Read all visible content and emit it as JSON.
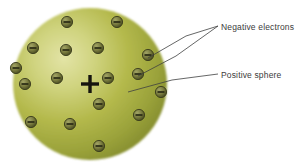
{
  "figure": {
    "background_color": "#ffffff"
  },
  "sphere": {
    "name": "positive-sphere",
    "cx": 90,
    "cy": 84,
    "rx": 77,
    "ry": 76,
    "fill_center_color": "#dcdd9a",
    "fill_mid_color": "#b6bb4b",
    "fill_edge_color": "#8e9633",
    "highlight_cx_pct": 33,
    "highlight_cy_pct": 33
  },
  "nucleus": {
    "name": "positive-charge-plus",
    "symbol": "+",
    "cx": 90,
    "cy": 84,
    "arm": 9,
    "thickness": 3.4,
    "color": "#16150f"
  },
  "electrons": {
    "name": "negative-electrons",
    "symbol": "−",
    "count": 17,
    "radius": 5.6,
    "body_color": "#8d8f4e",
    "body_dark_color": "#5d5f2d",
    "edge_color": "#3a3b1c",
    "bar_color": "#2b2c14",
    "positions": [
      {
        "x": 67,
        "y": 22
      },
      {
        "x": 117,
        "y": 22
      },
      {
        "x": 33,
        "y": 48
      },
      {
        "x": 66,
        "y": 50
      },
      {
        "x": 98,
        "y": 48
      },
      {
        "x": 148,
        "y": 55
      },
      {
        "x": 25,
        "y": 84
      },
      {
        "x": 57,
        "y": 78
      },
      {
        "x": 108,
        "y": 78
      },
      {
        "x": 138,
        "y": 74
      },
      {
        "x": 99,
        "y": 104
      },
      {
        "x": 31,
        "y": 122
      },
      {
        "x": 70,
        "y": 124
      },
      {
        "x": 139,
        "y": 115
      },
      {
        "x": 99,
        "y": 146
      },
      {
        "x": 161,
        "y": 92
      },
      {
        "x": 16,
        "y": 68
      }
    ]
  },
  "leaders": {
    "negative": {
      "name": "leader-negative-electrons",
      "color": "#3f4040",
      "width": 0.8,
      "text_anchor": {
        "x": 218,
        "y": 26
      },
      "branches": [
        [
          [
            218,
            26
          ],
          [
            186,
            36
          ],
          [
            148,
            58
          ]
        ],
        [
          [
            218,
            26
          ],
          [
            176,
            56
          ],
          [
            138,
            76
          ]
        ]
      ]
    },
    "positive": {
      "name": "leader-positive-sphere",
      "color": "#3f4040",
      "width": 0.8,
      "text_anchor": {
        "x": 218,
        "y": 74
      },
      "path": [
        [
          218,
          74
        ],
        [
          172,
          80
        ],
        [
          128,
          92
        ]
      ]
    }
  },
  "labels": {
    "negative_electrons": "Negative electrons",
    "positive_sphere": "Positive sphere"
  }
}
